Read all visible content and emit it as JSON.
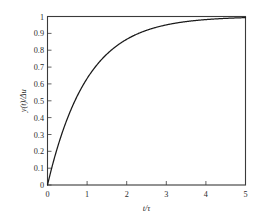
{
  "chart_data": {
    "type": "line",
    "title": "",
    "subtitle": "",
    "xlabel": "t/τ",
    "ylabel": "y(t)/Δu",
    "xlim": [
      0,
      5
    ],
    "ylim": [
      0,
      1
    ],
    "grid": false,
    "legend": null,
    "legend_position": "none",
    "frame": "box",
    "tick_direction": "in",
    "x_ticks": [
      0,
      1,
      2,
      3,
      4,
      5
    ],
    "x_tick_labels": [
      "0",
      "1",
      "2",
      "3",
      "4",
      "5"
    ],
    "y_ticks": [
      0,
      0.1,
      0.2,
      0.3,
      0.4,
      0.5,
      0.6,
      0.7,
      0.8,
      0.9,
      1
    ],
    "y_tick_labels": [
      "0",
      "0.1",
      "0.2",
      "0.3",
      "0.4",
      "0.5",
      "0.6",
      "0.7",
      "0.8",
      "0.9",
      "1"
    ],
    "series": [
      {
        "name": "first-order step response",
        "equation": "y = 1 - exp(-x)",
        "color": "#1a1a1a",
        "x": [
          0,
          0.1,
          0.2,
          0.3,
          0.4,
          0.5,
          0.6,
          0.7,
          0.8,
          0.9,
          1,
          1.2,
          1.4,
          1.6,
          1.8,
          2,
          2.25,
          2.5,
          2.75,
          3,
          3.25,
          3.5,
          3.75,
          4,
          4.25,
          4.5,
          4.75,
          5
        ],
        "values": [
          0,
          0.095,
          0.181,
          0.259,
          0.33,
          0.393,
          0.451,
          0.503,
          0.551,
          0.593,
          0.632,
          0.699,
          0.753,
          0.798,
          0.835,
          0.865,
          0.895,
          0.918,
          0.936,
          0.95,
          0.961,
          0.97,
          0.976,
          0.982,
          0.986,
          0.989,
          0.991,
          0.993
        ]
      }
    ],
    "annotations": []
  },
  "axes": {
    "y_axis_label": "y(t)/Δu",
    "x_axis_label": "t/τ"
  },
  "colors": {
    "curve": "#1a1a1a",
    "frame": "#3a3a3a",
    "background": "#ffffff",
    "text": "#2b2b2b"
  }
}
